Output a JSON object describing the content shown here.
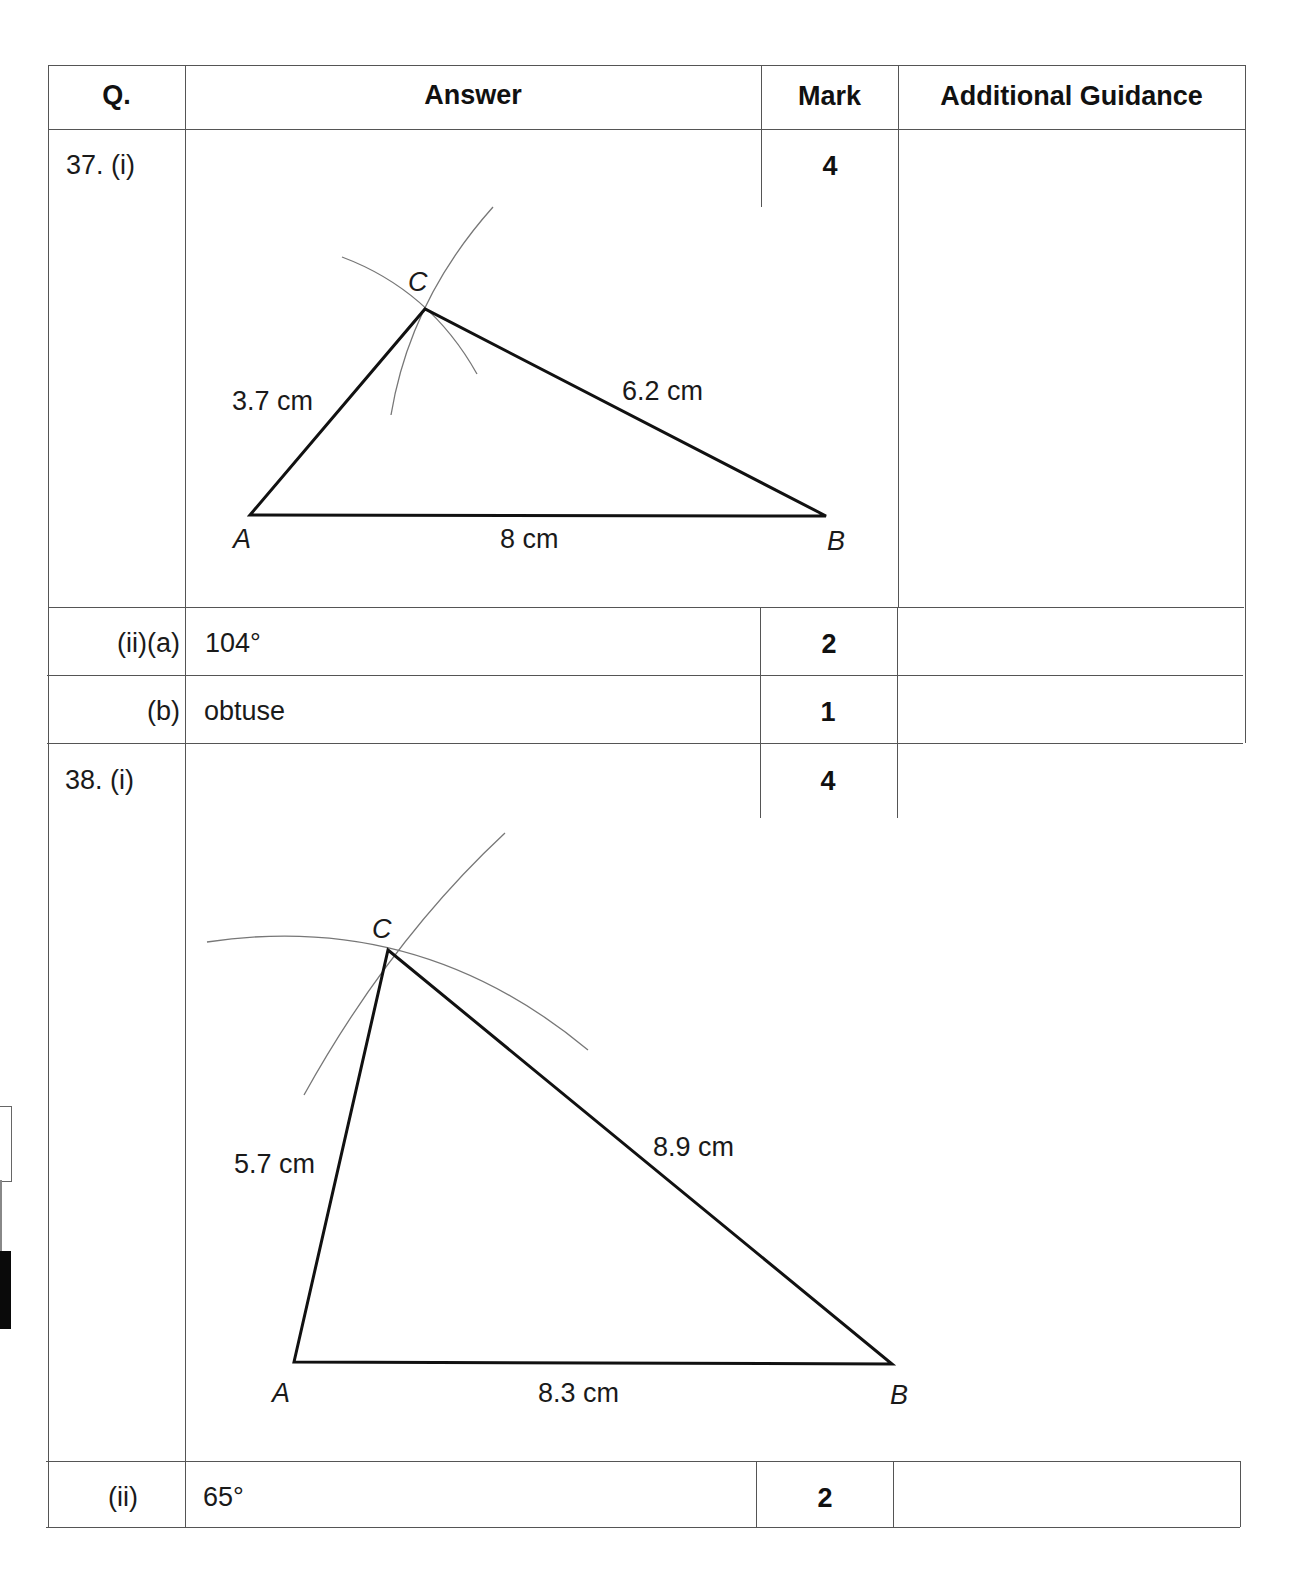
{
  "table": {
    "headers": {
      "question": "Q.",
      "answer": "Answer",
      "mark": "Mark",
      "guidance": "Additional Guidance"
    },
    "rows": [
      {
        "q": "37. (i)",
        "answer": "",
        "mark": "4",
        "guidance": "",
        "diagram": {
          "type": "triangle-construction",
          "vertices": {
            "A": "A",
            "B": "B",
            "C": "C"
          },
          "sides": {
            "AC": "3.7 cm",
            "CB": "6.2 cm",
            "AB": "8 cm"
          }
        }
      },
      {
        "q": "(ii)(a)",
        "answer": "104°",
        "mark": "2",
        "guidance": ""
      },
      {
        "q": "(b)",
        "answer": "obtuse",
        "mark": "1",
        "guidance": ""
      },
      {
        "q": "38. (i)",
        "answer": "",
        "mark": "4",
        "guidance": "",
        "diagram": {
          "type": "triangle-construction",
          "vertices": {
            "A": "A",
            "B": "B",
            "C": "C"
          },
          "sides": {
            "AC": "5.7 cm",
            "CB": "8.9 cm",
            "AB": "8.3 cm"
          }
        }
      },
      {
        "q": "(ii)",
        "answer": "65°",
        "mark": "2",
        "guidance": ""
      }
    ]
  }
}
